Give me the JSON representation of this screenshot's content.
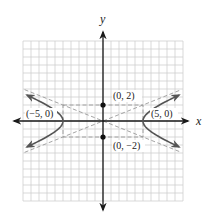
{
  "chart_data": {
    "type": "line",
    "title": "",
    "xlabel": "x",
    "ylabel": "y",
    "xlim": [
      -10,
      10
    ],
    "ylim": [
      -10,
      10
    ],
    "grid": true,
    "grid_step": 1,
    "legend": null,
    "series": [
      {
        "name": "hyperbola",
        "equation": "x^2/25 - y^2/4 = 1",
        "style": "solid",
        "color": "#555555",
        "branches": [
          "right",
          "left"
        ],
        "x_extent": [
          -9.5,
          9.5
        ]
      },
      {
        "name": "asymptote-positive",
        "equation": "y = (2/5)x",
        "style": "dashed",
        "color": "#9a9a9a"
      },
      {
        "name": "asymptote-negative",
        "equation": "y = -(2/5)x",
        "style": "dashed",
        "color": "#9a9a9a"
      },
      {
        "name": "fundamental-rectangle",
        "corners": [
          [
            -5,
            2
          ],
          [
            5,
            2
          ],
          [
            5,
            -2
          ],
          [
            -5,
            -2
          ]
        ],
        "style": "dashed",
        "color": "#9a9a9a"
      }
    ],
    "points": [
      {
        "x": 0,
        "y": 2,
        "label": "(0, 2)",
        "marker": "dot"
      },
      {
        "x": 0,
        "y": -2,
        "label": "(0, −2)",
        "marker": "dot"
      },
      {
        "x": -5,
        "y": 0,
        "label": "(−5, 0)",
        "marker": "vertex"
      },
      {
        "x": 5,
        "y": 0,
        "label": "(5, 0)",
        "marker": "vertex"
      }
    ]
  },
  "labels": {
    "x_axis": "x",
    "y_axis": "y",
    "p_top": "(0, 2)",
    "p_bottom": "(0, −2)",
    "p_left": "(−5, 0)",
    "p_right": "(5, 0)"
  },
  "colors": {
    "grid": "#cfcfcf",
    "axis": "#1a1a1a",
    "curve": "#555555",
    "dashed": "#9a9a9a",
    "point": "#111111"
  }
}
